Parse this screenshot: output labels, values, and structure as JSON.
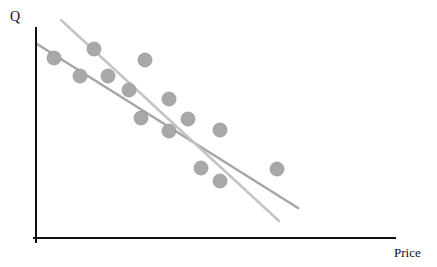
{
  "chart_data": {
    "type": "scatter",
    "title": "",
    "xlabel": "Price",
    "ylabel": "Q",
    "grid": false,
    "legend": null,
    "ticks": {
      "x": [],
      "y": []
    },
    "points_px": [
      {
        "x": 54,
        "y": 58
      },
      {
        "x": 80,
        "y": 76
      },
      {
        "x": 94,
        "y": 49
      },
      {
        "x": 108,
        "y": 76
      },
      {
        "x": 129,
        "y": 90
      },
      {
        "x": 145,
        "y": 60
      },
      {
        "x": 141,
        "y": 118
      },
      {
        "x": 169,
        "y": 99
      },
      {
        "x": 169,
        "y": 131
      },
      {
        "x": 188,
        "y": 119
      },
      {
        "x": 220,
        "y": 130
      },
      {
        "x": 201,
        "y": 168
      },
      {
        "x": 220,
        "y": 181
      },
      {
        "x": 277,
        "y": 169
      }
    ],
    "series": [
      {
        "name": "fit-line-1",
        "type": "line",
        "color": "#a6a6a6",
        "x1": 37,
        "y1": 44,
        "x2": 298,
        "y2": 208
      },
      {
        "name": "fit-line-2",
        "type": "line",
        "color": "#c4c4c4",
        "x1": 61,
        "y1": 20,
        "x2": 279,
        "y2": 221
      }
    ],
    "axes": {
      "y_axis": {
        "x": 36,
        "y1": 27,
        "y2": 243
      },
      "x_axis": {
        "y": 238,
        "x1": 33,
        "x2": 396
      }
    },
    "colors": {
      "point_fill": "#a8a8a8",
      "point_stroke": "#999999",
      "axis": "#111111"
    }
  }
}
